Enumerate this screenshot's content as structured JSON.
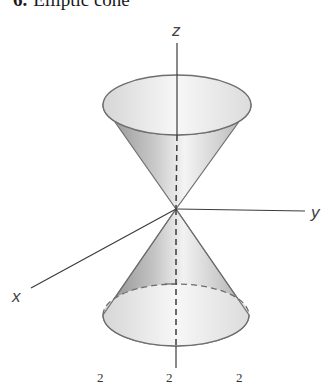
{
  "title": {
    "number": "6.",
    "text": "Elliptic cone"
  },
  "axes": {
    "z_label": "z",
    "y_label": "y",
    "x_label": "x"
  },
  "equation_fragment": {
    "superscripts": [
      "2",
      "2",
      "2"
    ]
  },
  "colors": {
    "outline": "#6e6e6e",
    "axis": "#3c3c3c",
    "cone_dark": "#9a9a9a",
    "cone_light": "#f2f2f2",
    "ellipse_fill": "#e6e6e6"
  }
}
